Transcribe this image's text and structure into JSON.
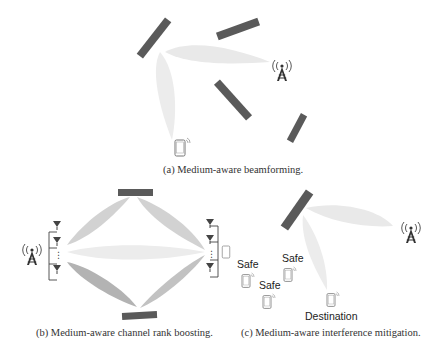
{
  "colors": {
    "surface": "#5a5a5a",
    "beam_light": "#e6e6e6",
    "beam_dark": "#b5b5b5",
    "beam_mid": "#d0d0d0",
    "icon": "#333333",
    "device": "#777777"
  },
  "panels": [
    {
      "id": "a",
      "caption": "(a)  Medium-aware beamforming."
    },
    {
      "id": "b",
      "caption": "(b)  Medium-aware channel rank boosting.",
      "antenna_dots": "⋮"
    },
    {
      "id": "c",
      "caption": "(c)  Medium-aware interference mitigation.",
      "labels": {
        "safe_1": "Safe",
        "safe_2": "Safe",
        "safe_3": "Safe",
        "destination": "Destination"
      }
    }
  ]
}
